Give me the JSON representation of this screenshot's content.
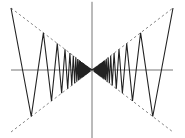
{
  "chart_data": {
    "type": "line",
    "title": "",
    "xlabel": "",
    "ylabel": "",
    "xlim": [
      -1.02,
      1.02
    ],
    "ylim": [
      -1.0,
      1.15
    ],
    "grid": false,
    "legend": "none",
    "axes": {
      "x_axis_at": 0,
      "y_axis_at": 0,
      "x_axis_extent": [
        -1.0,
        1.0
      ],
      "y_axis_extent": [
        -1.1,
        1.1
      ]
    },
    "series": [
      {
        "name": "f(x) zig-zag",
        "style": "solid",
        "color": "#222222",
        "description": "Piecewise-linear even function oscillating between the envelopes y = |x| and y = -|x|, with extremes at x = ±1/(1 + k/3), k = 0,1,2,..., sign alternating (+ at k even)",
        "extremes_right": {
          "x": [
            1.0,
            0.75,
            0.6,
            0.5,
            0.4286,
            0.375,
            0.3333,
            0.3,
            0.2727,
            0.25
          ],
          "y": [
            1.0,
            -0.75,
            0.6,
            -0.5,
            0.4286,
            -0.375,
            0.3333,
            -0.3,
            0.2727,
            -0.25
          ]
        },
        "generator": {
          "k_max": 120
        }
      },
      {
        "name": "y = x",
        "style": "dashed",
        "color": "#888888",
        "x": [
          -1.0,
          1.0
        ],
        "y": [
          -1.0,
          1.0
        ]
      },
      {
        "name": "y = -x",
        "style": "dashed",
        "color": "#888888",
        "x": [
          -1.0,
          1.0
        ],
        "y": [
          1.0,
          -1.0
        ]
      }
    ]
  }
}
